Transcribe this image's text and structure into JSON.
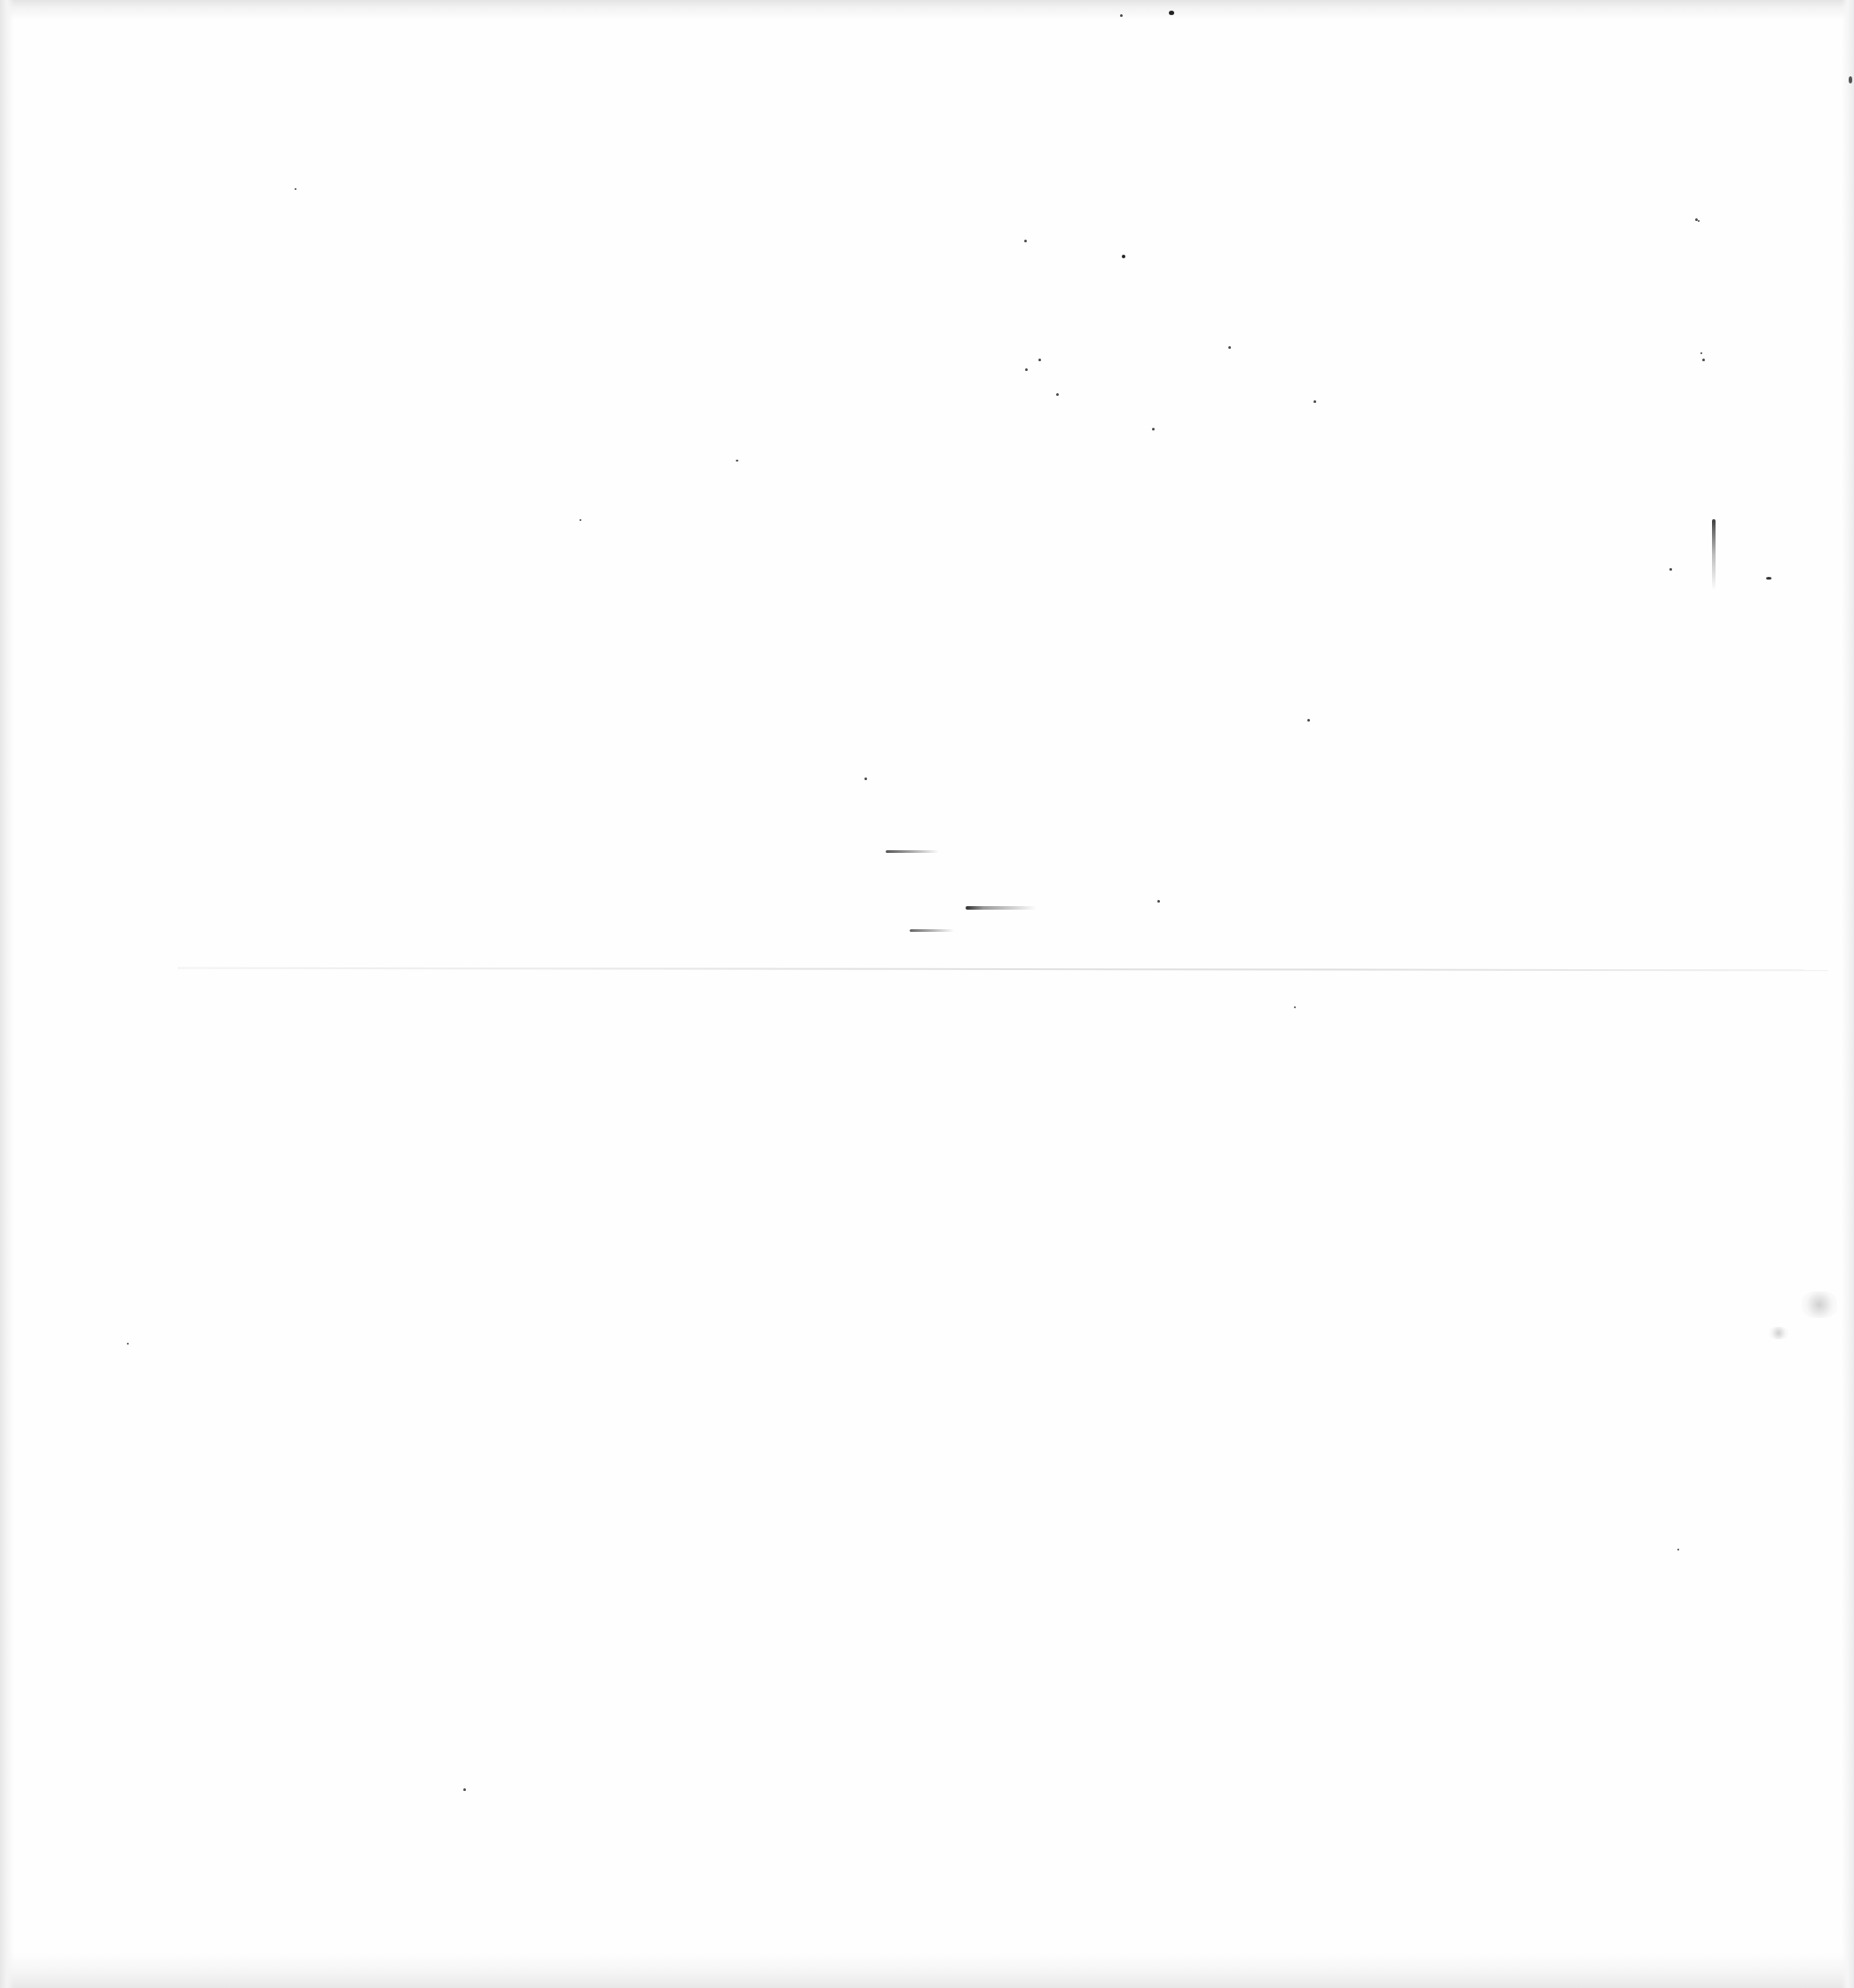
{
  "page": {
    "type": "blank-scanned-page",
    "background_color": "#fefefe",
    "text_content": "",
    "artifacts": {
      "fold_line": {
        "y": 1092,
        "color": "#dedede"
      },
      "vertical_streak": {
        "x": 1929,
        "y": 585,
        "height": 80,
        "color": "#3a3a3a"
      },
      "smudges": [
        {
          "x": 998,
          "y": 958,
          "width": 60,
          "color": "#555555"
        },
        {
          "x": 1088,
          "y": 1021,
          "width": 80,
          "color": "#2e2e2e"
        },
        {
          "x": 1025,
          "y": 1047,
          "width": 50,
          "color": "#666666"
        }
      ],
      "stains": [
        {
          "x": 1990,
          "y": 1455,
          "width": 40,
          "height": 30
        },
        {
          "x": 1993,
          "y": 1495,
          "width": 22,
          "height": 14
        }
      ]
    }
  }
}
